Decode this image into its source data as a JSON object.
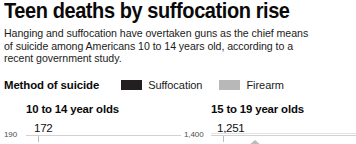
{
  "headline": "Teen deaths by suffocation rise",
  "deck": {
    "lines": [
      "Hanging and suffocation have overtaken guns as the chief means",
      "of suicide among Americans 10 to 14 years old, according to a",
      "recent government study."
    ]
  },
  "legend": {
    "title": "Method of suicide",
    "items": [
      {
        "label": "Suffocation",
        "color": "#231f20",
        "swatch_name": "legend-swatch-suffocation"
      },
      {
        "label": "Firearm",
        "color": "#b8b8b8",
        "swatch_name": "legend-swatch-firearm"
      }
    ]
  },
  "panels": [
    {
      "title": "10 to 14 year olds",
      "axis_max": "190",
      "peak_label": "172"
    },
    {
      "title": "15 to 19 year olds",
      "axis_max": "1,400",
      "peak_label": "1,251"
    }
  ],
  "colors": {
    "suffocation": "#231f20",
    "firearm": "#b8b8b8",
    "background": "#ffffff",
    "text": "#0a0a0a",
    "gridline": "#d2d2d2"
  },
  "chart_data": {
    "type": "area",
    "title": "Teen deaths by suffocation rise",
    "subtitle": "Hanging and suffocation have overtaken guns as the chief means of suicide among Americans 10 to 14 years old, according to a recent government study.",
    "grid": true,
    "legend_position": "top",
    "legend_title": "Method of suicide",
    "note": "Graphic is cropped at the bottom; only the top of each plot area, its maximum axis tick and the peak value label are visible.",
    "panels": [
      {
        "name": "10 to 14 year olds",
        "ylabel": "",
        "xlabel": "",
        "ylim": [
          0,
          190
        ],
        "yticks": [
          190
        ],
        "ytick_labels": [
          "190"
        ],
        "annotations": [
          {
            "text": "172",
            "series": "Suffocation",
            "value": 172
          }
        ],
        "series": [
          {
            "name": "Suffocation",
            "color": "#231f20",
            "peak_value": 172
          },
          {
            "name": "Firearm",
            "color": "#b8b8b8",
            "peak_value": null
          }
        ]
      },
      {
        "name": "15 to 19 year olds",
        "ylabel": "",
        "xlabel": "",
        "ylim": [
          0,
          1400
        ],
        "yticks": [
          1400
        ],
        "ytick_labels": [
          "1,400"
        ],
        "annotations": [
          {
            "text": "1,251",
            "series": "Suffocation",
            "value": 1251
          }
        ],
        "series": [
          {
            "name": "Suffocation",
            "color": "#231f20",
            "peak_value": 1251
          },
          {
            "name": "Firearm",
            "color": "#b8b8b8",
            "peak_value": null
          }
        ]
      }
    ]
  }
}
